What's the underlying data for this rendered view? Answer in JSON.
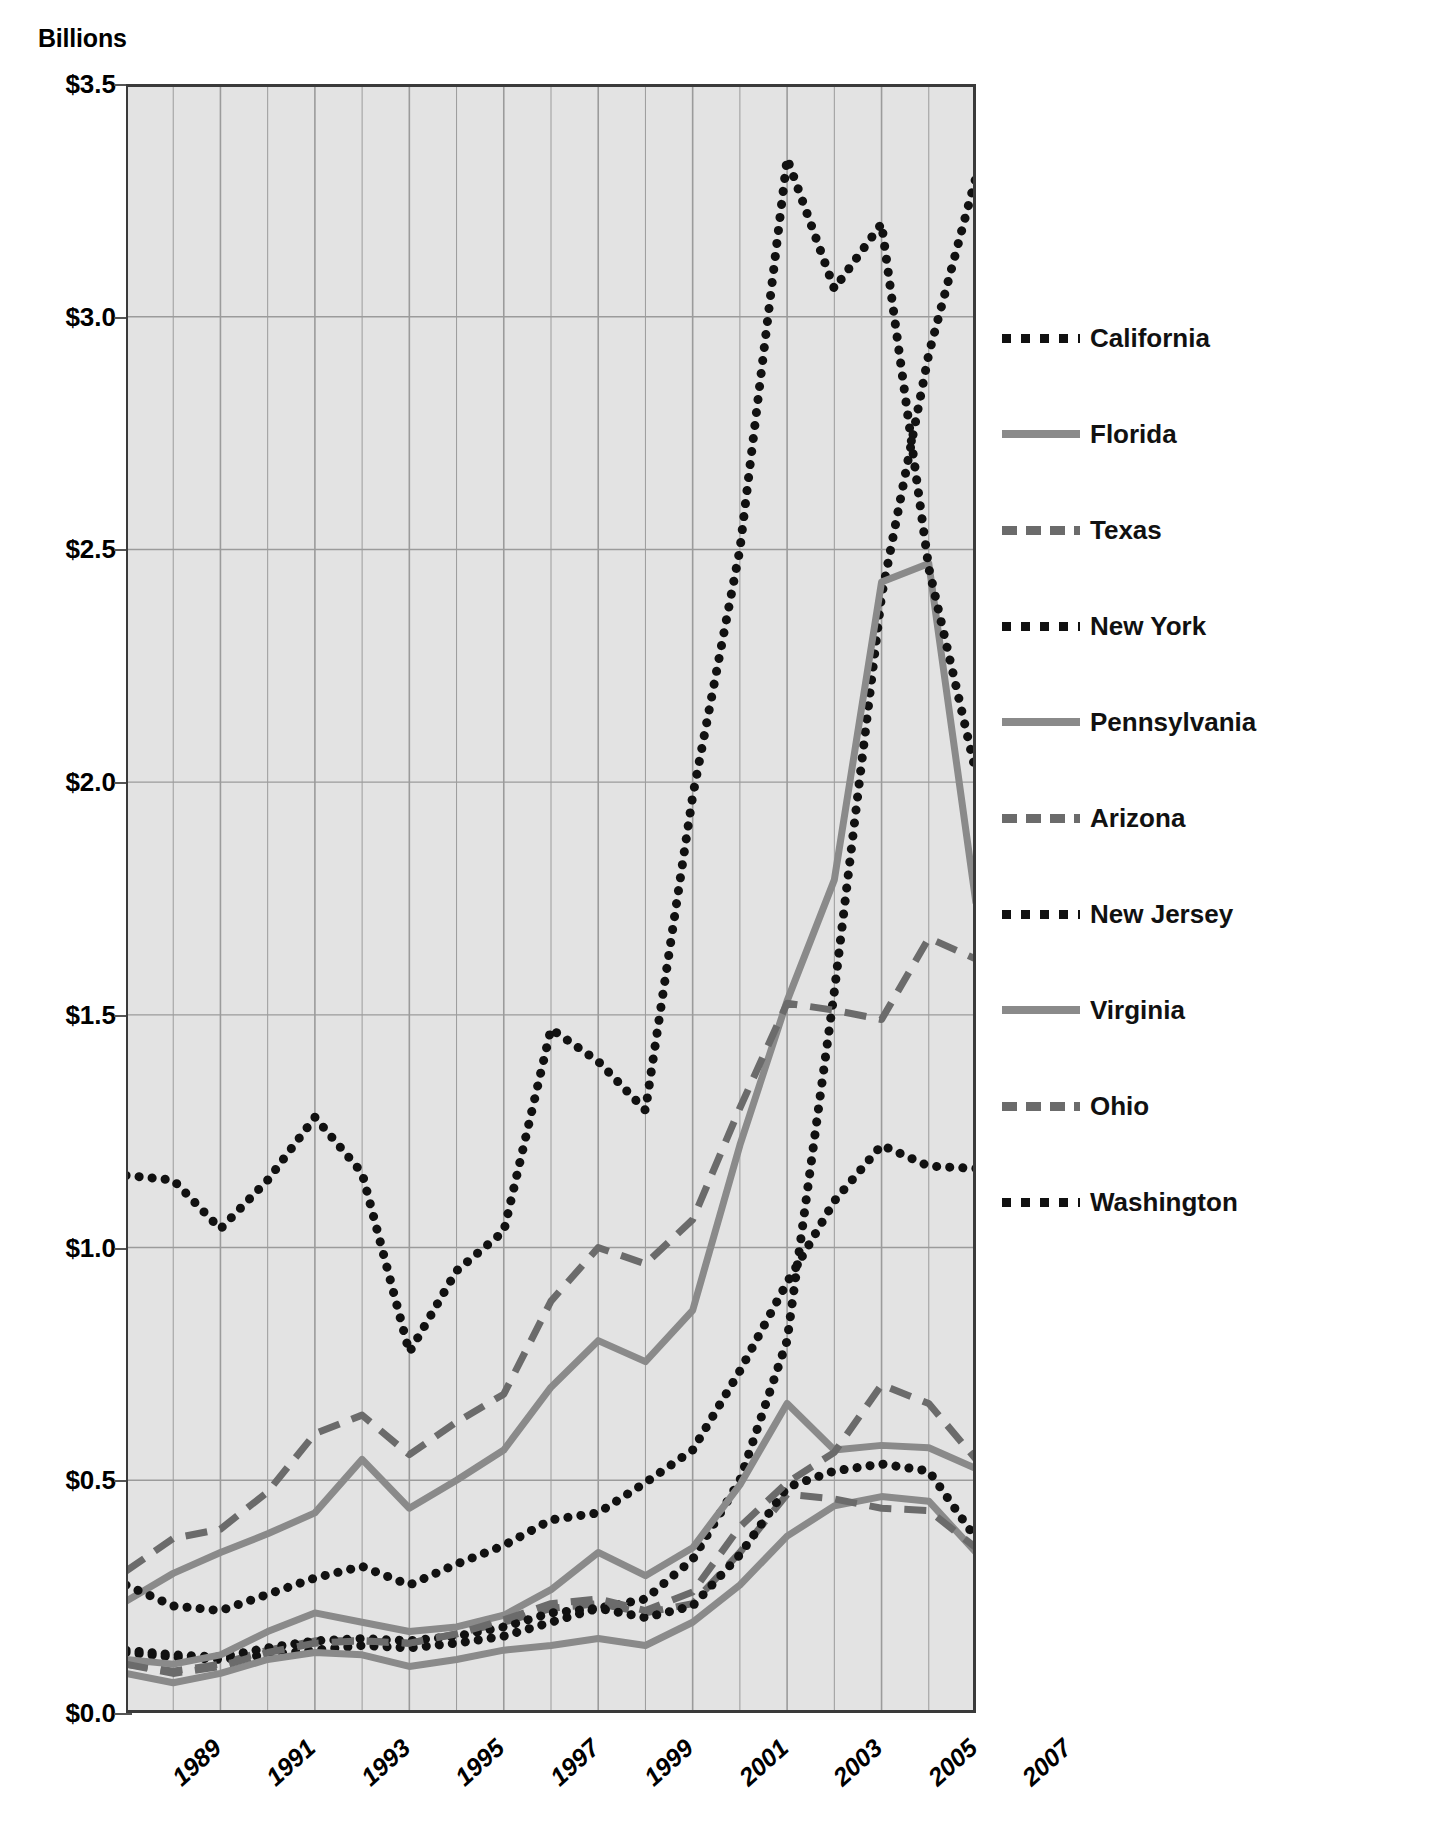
{
  "chart_data": {
    "type": "line",
    "title": "",
    "xlabel": "",
    "ylabel": "Billions",
    "unit_label": "Billions",
    "x": [
      1989,
      1990,
      1991,
      1992,
      1993,
      1994,
      1995,
      1996,
      1997,
      1998,
      1999,
      2000,
      2001,
      2002,
      2003,
      2004,
      2005,
      2006,
      2007
    ],
    "xtick_labels": [
      "1989",
      "1991",
      "1993",
      "1995",
      "1997",
      "1999",
      "2001",
      "2003",
      "2005",
      "2007"
    ],
    "xtick_values": [
      1989,
      1991,
      1993,
      1995,
      1997,
      1999,
      2001,
      2003,
      2005,
      2007
    ],
    "ytick_labels": [
      "$3.5",
      "$3.0",
      "$2.5",
      "$2.0",
      "$1.5",
      "$1.0",
      "$0.5",
      "$0.0"
    ],
    "ytick_values": [
      3.5,
      3.0,
      2.5,
      2.0,
      1.5,
      1.0,
      0.5,
      0.0
    ],
    "ylim": [
      0.0,
      3.5
    ],
    "xlim": [
      1989,
      2007
    ],
    "grid": "vertical-and-horizontal",
    "plot_background": "#e3e3e3",
    "legend_position": "right",
    "series": [
      {
        "name": "California",
        "style": "dotted",
        "color": "#111111",
        "values": [
          0.13,
          0.12,
          0.115,
          0.125,
          0.135,
          0.145,
          0.14,
          0.15,
          0.165,
          0.195,
          0.225,
          0.245,
          0.33,
          0.5,
          0.8,
          1.55,
          2.4,
          2.92,
          3.3
        ]
      },
      {
        "name": "Florida",
        "style": "solid",
        "color": "#8a8a8a",
        "values": [
          0.24,
          0.3,
          0.345,
          0.385,
          0.43,
          0.545,
          0.44,
          0.5,
          0.565,
          0.7,
          0.8,
          0.755,
          0.865,
          1.22,
          1.53,
          1.79,
          2.43,
          2.47,
          1.74
        ]
      },
      {
        "name": "Texas",
        "style": "dashed",
        "color": "#6b6b6b",
        "values": [
          0.305,
          0.375,
          0.395,
          0.475,
          0.6,
          0.64,
          0.555,
          0.625,
          0.685,
          0.885,
          1.0,
          0.965,
          1.06,
          1.3,
          1.525,
          1.51,
          1.49,
          1.665,
          1.62
        ]
      },
      {
        "name": "New York",
        "style": "dotted",
        "color": "#111111",
        "values": [
          1.155,
          1.145,
          1.04,
          1.145,
          1.28,
          1.16,
          0.775,
          0.95,
          1.035,
          1.47,
          1.4,
          1.295,
          1.97,
          2.5,
          3.34,
          3.06,
          3.2,
          2.46,
          2.02
        ]
      },
      {
        "name": "Pennsylvania",
        "style": "solid",
        "color": "#8a8a8a",
        "values": [
          0.085,
          0.065,
          0.085,
          0.115,
          0.13,
          0.125,
          0.1,
          0.115,
          0.135,
          0.145,
          0.16,
          0.145,
          0.195,
          0.275,
          0.38,
          0.445,
          0.465,
          0.455,
          0.345
        ]
      },
      {
        "name": "Arizona",
        "style": "dashed",
        "color": "#6b6b6b",
        "values": [
          0.105,
          0.09,
          0.105,
          0.135,
          0.155,
          0.155,
          0.15,
          0.17,
          0.195,
          0.225,
          0.235,
          0.215,
          0.235,
          0.345,
          0.47,
          0.46,
          0.44,
          0.435,
          0.355
        ]
      },
      {
        "name": "New Jersey",
        "style": "dotted",
        "color": "#111111",
        "values": [
          0.135,
          0.125,
          0.12,
          0.14,
          0.155,
          0.16,
          0.155,
          0.165,
          0.185,
          0.215,
          0.225,
          0.205,
          0.23,
          0.34,
          0.485,
          0.52,
          0.535,
          0.52,
          0.375
        ]
      },
      {
        "name": "Virginia",
        "style": "solid",
        "color": "#8a8a8a",
        "values": [
          0.115,
          0.105,
          0.125,
          0.175,
          0.215,
          0.195,
          0.175,
          0.185,
          0.21,
          0.265,
          0.345,
          0.295,
          0.355,
          0.49,
          0.665,
          0.565,
          0.575,
          0.57,
          0.525
        ]
      },
      {
        "name": "Ohio",
        "style": "dashed",
        "color": "#6b6b6b",
        "values": [
          0.105,
          0.085,
          0.1,
          0.13,
          0.15,
          0.155,
          0.15,
          0.17,
          0.2,
          0.235,
          0.245,
          0.22,
          0.26,
          0.4,
          0.495,
          0.56,
          0.705,
          0.665,
          0.545
        ]
      },
      {
        "name": "Washington",
        "style": "dotted",
        "color": "#111111",
        "values": [
          0.275,
          0.23,
          0.22,
          0.255,
          0.29,
          0.315,
          0.275,
          0.32,
          0.36,
          0.415,
          0.43,
          0.495,
          0.565,
          0.735,
          0.925,
          1.1,
          1.22,
          1.175,
          1.17
        ]
      }
    ]
  },
  "legend": {
    "items": [
      {
        "label": "California",
        "style": "dotted",
        "color": "#111111"
      },
      {
        "label": "Florida",
        "style": "solid",
        "color": "#8a8a8a"
      },
      {
        "label": "Texas",
        "style": "dashed",
        "color": "#6b6b6b"
      },
      {
        "label": "New York",
        "style": "dotted",
        "color": "#111111"
      },
      {
        "label": "Pennsylvania",
        "style": "solid",
        "color": "#8a8a8a"
      },
      {
        "label": "Arizona",
        "style": "dashed",
        "color": "#6b6b6b"
      },
      {
        "label": "New Jersey",
        "style": "dotted",
        "color": "#111111"
      },
      {
        "label": "Virginia",
        "style": "solid",
        "color": "#8a8a8a"
      },
      {
        "label": "Ohio",
        "style": "dashed",
        "color": "#6b6b6b"
      },
      {
        "label": "Washington",
        "style": "dotted",
        "color": "#111111"
      }
    ]
  },
  "axes": {
    "unit_label": "Billions"
  },
  "colors": {
    "plot_bg": "#e3e3e3",
    "grid": "#9b9b9b",
    "axis": "#4d4d4d",
    "dark_series": "#111111",
    "gray_series": "#8a8a8a",
    "dashed_series": "#6b6b6b"
  }
}
